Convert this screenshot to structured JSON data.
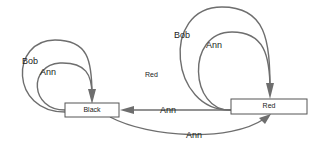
{
  "diagram": {
    "type": "state-transition graph",
    "nodes": [
      {
        "id": "black",
        "label": "Black"
      },
      {
        "id": "red",
        "label": "Red"
      }
    ],
    "edges": [
      {
        "from": "black",
        "to": "black",
        "label": "Bob"
      },
      {
        "from": "black",
        "to": "black",
        "label": "Ann"
      },
      {
        "from": "red",
        "to": "red",
        "label": "Bob"
      },
      {
        "from": "red",
        "to": "red",
        "label": "Ann"
      },
      {
        "from": "red",
        "to": "black",
        "label": "Ann"
      },
      {
        "from": "black",
        "to": "red",
        "label": "Ann"
      }
    ],
    "free_labels": [
      {
        "text": "Red"
      }
    ],
    "colors": {
      "edge": "#6e6e6e",
      "node_border": "#555555",
      "text": "#222222",
      "background": "#ffffff"
    }
  }
}
